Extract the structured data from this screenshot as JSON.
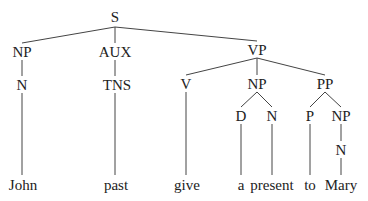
{
  "tree": {
    "nodes": [
      {
        "id": "S",
        "label": "S",
        "x": 115,
        "y": 17
      },
      {
        "id": "NP1",
        "label": "NP",
        "x": 22,
        "y": 52
      },
      {
        "id": "AUX",
        "label": "AUX",
        "x": 115,
        "y": 52
      },
      {
        "id": "VP",
        "label": "VP",
        "x": 257,
        "y": 50
      },
      {
        "id": "N1",
        "label": "N",
        "x": 22,
        "y": 85
      },
      {
        "id": "TNS",
        "label": "TNS",
        "x": 117,
        "y": 85
      },
      {
        "id": "V",
        "label": "V",
        "x": 186,
        "y": 84
      },
      {
        "id": "NP2",
        "label": "NP",
        "x": 257,
        "y": 84
      },
      {
        "id": "PP",
        "label": "PP",
        "x": 325,
        "y": 84
      },
      {
        "id": "D",
        "label": "D",
        "x": 241,
        "y": 116
      },
      {
        "id": "N2",
        "label": "N",
        "x": 272,
        "y": 116
      },
      {
        "id": "P",
        "label": "P",
        "x": 310,
        "y": 116
      },
      {
        "id": "NP3",
        "label": "NP",
        "x": 341,
        "y": 116
      },
      {
        "id": "N3",
        "label": "N",
        "x": 341,
        "y": 150
      },
      {
        "id": "w1",
        "label": "John",
        "x": 23,
        "y": 185
      },
      {
        "id": "w2",
        "label": "past",
        "x": 116,
        "y": 185
      },
      {
        "id": "w3",
        "label": "give",
        "x": 187,
        "y": 185
      },
      {
        "id": "w4",
        "label": "a",
        "x": 241,
        "y": 185
      },
      {
        "id": "w5",
        "label": "present",
        "x": 272,
        "y": 185
      },
      {
        "id": "w6",
        "label": "to",
        "x": 310,
        "y": 185
      },
      {
        "id": "w7",
        "label": "Mary",
        "x": 341,
        "y": 185
      }
    ],
    "edges": [
      [
        115,
        27,
        22,
        43
      ],
      [
        115,
        27,
        115,
        43
      ],
      [
        115,
        27,
        257,
        41
      ],
      [
        22,
        60,
        22,
        76
      ],
      [
        115,
        60,
        115,
        76
      ],
      [
        257,
        58,
        186,
        75
      ],
      [
        257,
        58,
        257,
        75
      ],
      [
        257,
        58,
        325,
        75
      ],
      [
        22,
        93,
        22,
        175
      ],
      [
        115,
        93,
        115,
        175
      ],
      [
        186,
        92,
        186,
        175
      ],
      [
        257,
        92,
        241,
        107
      ],
      [
        257,
        92,
        272,
        107
      ],
      [
        325,
        92,
        310,
        107
      ],
      [
        325,
        92,
        341,
        107
      ],
      [
        241,
        124,
        241,
        175
      ],
      [
        272,
        124,
        272,
        175
      ],
      [
        310,
        124,
        310,
        175
      ],
      [
        341,
        124,
        341,
        141
      ],
      [
        341,
        158,
        341,
        175
      ]
    ],
    "line_color": "#444444"
  }
}
